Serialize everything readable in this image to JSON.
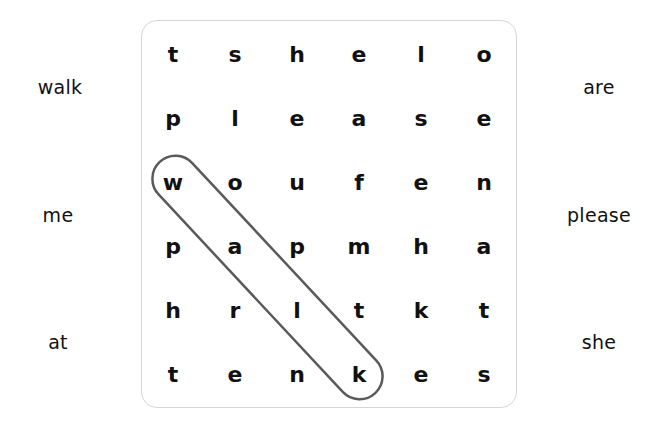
{
  "word_list": {
    "left": [
      "walk",
      "me",
      "at"
    ],
    "right": [
      "are",
      "please",
      "she"
    ]
  },
  "grid": {
    "rows": [
      [
        "t",
        "s",
        "h",
        "e",
        "l",
        "o"
      ],
      [
        "p",
        "l",
        "e",
        "a",
        "s",
        "e"
      ],
      [
        "w",
        "o",
        "u",
        "f",
        "e",
        "n"
      ],
      [
        "p",
        "a",
        "p",
        "m",
        "h",
        "a"
      ],
      [
        "h",
        "r",
        "l",
        "t",
        "k",
        "t"
      ],
      [
        "t",
        "e",
        "n",
        "k",
        "e",
        "s"
      ]
    ]
  },
  "found_words": [
    {
      "word": "walk",
      "start": [
        2,
        0
      ],
      "end": [
        5,
        3
      ],
      "color": "#5a5a5a"
    }
  ],
  "colors": {
    "border": "#d6d6d6",
    "highlight_stroke": "#5a5a5a",
    "text": "#111111"
  }
}
